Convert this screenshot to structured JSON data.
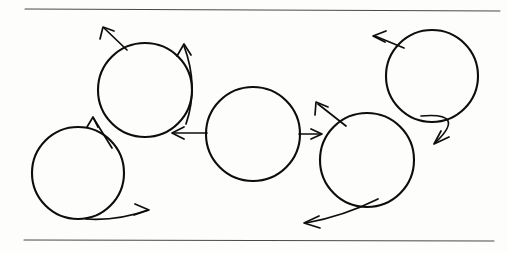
{
  "figure": {
    "canvas": {
      "width": 507,
      "height": 253,
      "background": "#fdfdfc"
    },
    "ink_color": "#0d0d0d",
    "rule_color": "#4a4a4a",
    "rules": [
      {
        "name": "top-rule",
        "x1": 25,
        "y1": 9,
        "x2": 500,
        "y2": 11
      },
      {
        "name": "bottom-rule",
        "x1": 24,
        "y1": 240,
        "x2": 494,
        "y2": 241
      }
    ],
    "circles": [
      {
        "name": "circle-1-left-low",
        "cx": 78,
        "cy": 173,
        "r": 46
      },
      {
        "name": "circle-2-upper-left",
        "cx": 145,
        "cy": 90,
        "r": 47
      },
      {
        "name": "circle-3-center",
        "cx": 253,
        "cy": 134,
        "r": 47
      },
      {
        "name": "circle-4-lower-right",
        "cx": 367,
        "cy": 160,
        "r": 47
      },
      {
        "name": "circle-5-upper-right",
        "cx": 432,
        "cy": 76,
        "r": 46
      }
    ],
    "arrows": [
      {
        "name": "arrow-circle1-bottom-sweep-right",
        "kind": "curved",
        "path": "M 86 219 Q 118 221 148 210",
        "head": "M 135 204 L 149 210 L 134 215",
        "from": "circle-1-left-low",
        "direction": "right"
      },
      {
        "name": "arrow-circle1-to-circle2",
        "kind": "straight",
        "path": "M 112 148 L 94 119",
        "head": "M 87 127 L 93 117 L 98 127",
        "from": "circle-1-left-low",
        "to": "circle-2-upper-left",
        "direction": "up-right"
      },
      {
        "name": "arrow-circle2-upper-left-out",
        "kind": "straight",
        "path": "M 127 50 L 104 28",
        "head": "M 100 39 L 103 27 L 114 31",
        "from": "circle-2-upper-left",
        "direction": "up-left"
      },
      {
        "name": "arrow-circle2-right-sweep-up",
        "kind": "curved",
        "path": "M 186 124 Q 199 86 184 46",
        "head": "M 177 56 L 184 44 L 191 55",
        "from": "circle-2-upper-left",
        "direction": "up"
      },
      {
        "name": "arrow-circle3-to-circle2",
        "kind": "straight",
        "path": "M 207 133 L 174 133",
        "head": "M 184 127 L 172 133 L 184 139",
        "from": "circle-3-center",
        "to": "circle-2-upper-left",
        "direction": "left"
      },
      {
        "name": "arrow-circle3-to-circle4",
        "kind": "straight",
        "path": "M 299 134 L 320 134",
        "head": "M 311 129 L 322 134 L 311 139",
        "from": "circle-3-center",
        "to": "circle-4-lower-right",
        "direction": "right"
      },
      {
        "name": "arrow-circle4-upper-left-out",
        "kind": "straight",
        "path": "M 346 126 L 318 104",
        "head": "M 315 115 L 316 102 L 328 107",
        "from": "circle-4-lower-right",
        "direction": "up-left"
      },
      {
        "name": "arrow-circle4-bottom-sweep-left",
        "kind": "curved",
        "path": "M 378 199 Q 344 216 306 223",
        "head": "M 319 216 L 304 223 L 320 228",
        "from": "circle-4-lower-right",
        "direction": "left"
      },
      {
        "name": "arrow-circle5-upper-left-out",
        "kind": "straight",
        "path": "M 404 48 L 375 36",
        "head": "M 386 31 L 373 36 L 385 42",
        "from": "circle-5-upper-right",
        "direction": "left"
      },
      {
        "name": "arrow-circle5-right-sweep-down",
        "kind": "curved",
        "path": "M 421 116 Q 467 112 436 142",
        "head": "M 449 137 L 434 144 L 441 131",
        "from": "circle-5-upper-right",
        "direction": "down-left"
      }
    ]
  }
}
